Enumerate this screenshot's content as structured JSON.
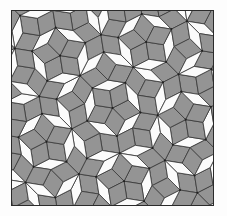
{
  "figure": {
    "name": "penrose-rhombus-tiling",
    "background_color": "#fdfdfd"
  },
  "frame": {
    "name": "tiling-border",
    "x": 11,
    "y": 10,
    "width": 203,
    "height": 196,
    "stroke_color": "#2b2b2b",
    "stroke_width": 1.5,
    "fill_color": "#ffffff"
  },
  "tiling": {
    "type": "penrose-p3-rhombus",
    "symmetry": "5-fold",
    "generations": 5,
    "seed_wheels": 10,
    "center_x": 101.5,
    "center_y": 98,
    "initial_radius": 196,
    "rotation_degrees": 9,
    "edge_stroke_color": "#3a3a3a",
    "edge_stroke_width": 0.85,
    "vertex_dot_color": "#202020",
    "vertex_dot_radius": 1.05,
    "tiles": [
      {
        "name": "fat-rhombus",
        "role": "thick",
        "angle_degrees": 72,
        "fill_color": "#949494",
        "count_label": "majority"
      },
      {
        "name": "thin-rhombus",
        "role": "thin",
        "angle_degrees": 36,
        "fill_color": "#fbfbfb",
        "count_label": "minority"
      }
    ],
    "motifs": [
      {
        "name": "five-point-star",
        "description": "five thin white rhombi meeting at a point"
      },
      {
        "name": "flower-rosette",
        "description": "ring of gray fat rhombi around a star"
      },
      {
        "name": "rhombus-cube-cluster",
        "description": "three fat rhombi forming a cube illusion"
      }
    ]
  },
  "colors": {
    "gray_tile": "#949494",
    "white_tile": "#fbfbfb",
    "edge": "#3a3a3a",
    "border": "#2b2b2b",
    "page": "#fdfdfd"
  }
}
